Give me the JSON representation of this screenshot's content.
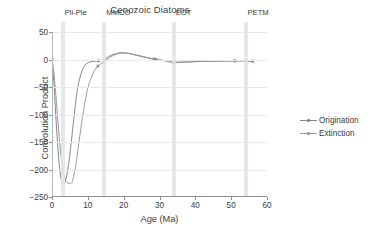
{
  "chart_data": {
    "type": "line",
    "title": "Cenozoic Diatoms",
    "xlabel": "Age (Ma)",
    "ylabel": "Convolution Product",
    "xlim": [
      0,
      60
    ],
    "ylim": [
      -250,
      50
    ],
    "xticks": [
      0,
      10,
      20,
      30,
      40,
      50,
      60
    ],
    "yticks": [
      50,
      0,
      -50,
      -100,
      -150,
      -200,
      -250
    ],
    "grid": "horizontal",
    "legend_position": "right",
    "series": [
      {
        "name": "Origination",
        "color": "#7a7a7a",
        "x": [
          0,
          0.5,
          1,
          1.5,
          2,
          2.5,
          3,
          3.5,
          4,
          4.5,
          5,
          5.5,
          6,
          7,
          8,
          9,
          10,
          11,
          12,
          13,
          14,
          14.5,
          15,
          16,
          17,
          18,
          19,
          20,
          21,
          22,
          24,
          26,
          28,
          29,
          30,
          32,
          34,
          36,
          38,
          40,
          42,
          44,
          46,
          48,
          50,
          51,
          52,
          53,
          54,
          55,
          56
        ],
        "y": [
          0,
          -40,
          -95,
          -148,
          -190,
          -215,
          -225,
          -224,
          -214,
          -196,
          -172,
          -143,
          -113,
          -58,
          -28,
          -12,
          -6,
          -4,
          -3,
          -2.5,
          -1.5,
          -1,
          2,
          6,
          9,
          11,
          12,
          12,
          11.5,
          10,
          7,
          4,
          1,
          0,
          -1,
          -3,
          -5.5,
          -5,
          -4.5,
          -4,
          -3.5,
          -3.2,
          -3,
          -2.8,
          -2.6,
          -2.5,
          -2.5,
          -2.5,
          -2.6,
          -2.8,
          -3
        ],
        "markers_x": [
          0,
          13,
          14.5,
          29,
          34,
          51,
          54,
          56
        ],
        "markers_y": [
          0,
          -2.5,
          -1,
          0,
          -5.5,
          -2.5,
          -2.6,
          -3
        ]
      },
      {
        "name": "Extinction",
        "color": "#8e8e8e",
        "x": [
          0,
          0.5,
          1,
          1.5,
          2,
          2.5,
          3,
          3.5,
          4,
          4.5,
          5,
          5.5,
          6,
          6.5,
          7,
          8,
          9,
          10,
          11,
          12,
          13,
          14,
          14.5,
          15,
          16,
          17,
          18,
          19,
          20,
          21,
          22,
          24,
          26,
          28,
          29,
          30,
          32,
          34,
          36,
          38,
          40,
          42,
          44,
          46,
          48,
          50,
          51,
          52,
          53,
          54,
          55,
          56
        ],
        "y": [
          0,
          -22,
          -58,
          -100,
          -140,
          -174,
          -199,
          -214,
          -222,
          -225,
          -225,
          -224,
          -214,
          -198,
          -176,
          -128,
          -85,
          -52,
          -32,
          -19,
          -11,
          -6,
          -4,
          -1,
          3,
          7,
          10,
          11.5,
          12,
          11.5,
          10.5,
          7.5,
          4.5,
          1.5,
          0.5,
          -0.5,
          -2.5,
          -5,
          -4.8,
          -4.3,
          -3.8,
          -3.4,
          -3.1,
          -2.9,
          -2.7,
          -2.5,
          -2.4,
          -2.4,
          -2.5,
          -2.6,
          -2.8,
          -3
        ],
        "markers_x": [
          0,
          12.8,
          14.3,
          28.5,
          34,
          51,
          54,
          56
        ],
        "markers_y": [
          0,
          -12,
          -6,
          1.2,
          -5,
          -2.5,
          -2.5,
          -3
        ]
      }
    ],
    "events": [
      {
        "id": "pli-ple",
        "label": "Pli-Ple",
        "age": 3.0,
        "label_offset": 0
      },
      {
        "id": "mmco",
        "label": "MMCO",
        "age": 14.6,
        "label_offset": 0
      },
      {
        "id": "eot",
        "label": "EOT",
        "age": 34.0,
        "label_offset": 0
      },
      {
        "id": "petm",
        "label": "PETM",
        "age": 54.0,
        "label_offset": 0
      }
    ],
    "event_band_color": "#dfe4ea"
  },
  "legend": {
    "items": [
      {
        "label": "Origination"
      },
      {
        "label": "Extinction"
      }
    ]
  }
}
